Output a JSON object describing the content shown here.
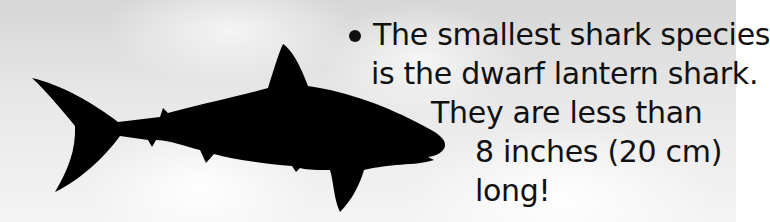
{
  "fact": {
    "bullet": "•",
    "lines": [
      "The smallest shark species",
      "is the dwarf lantern shark.",
      "They are less than",
      "8 inches (20 cm)",
      "long!"
    ]
  },
  "illustration": {
    "subject": "shark silhouette",
    "background": "cloudy sky",
    "silhouette_color": "#000000",
    "text_color": "#111111"
  }
}
